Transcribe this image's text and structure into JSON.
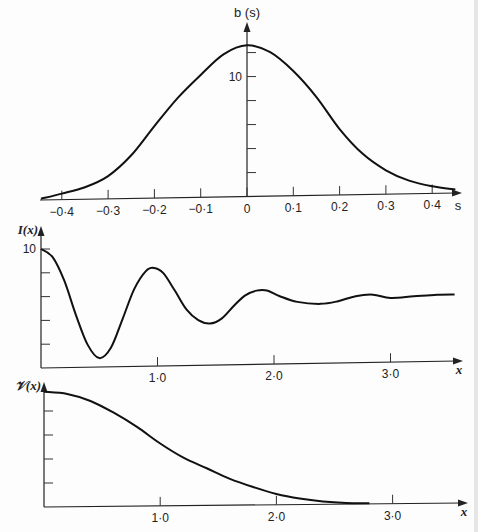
{
  "chart_data": [
    {
      "id": "top",
      "type": "line",
      "title": "",
      "ylabel": "b (s)",
      "xlabel": "s",
      "x_ticks": [
        -0.4,
        -0.3,
        -0.2,
        -0.1,
        0,
        0.1,
        0.2,
        0.3,
        0.4
      ],
      "x_tick_labels": [
        "−0·4",
        "−0·3",
        "−0·2",
        "−0·1",
        "0",
        "0·1",
        "0·2",
        "0·3",
        "0·4"
      ],
      "y_ticks": [
        2,
        4,
        6,
        8,
        10,
        12
      ],
      "y_tick_labels": {
        "10": "10"
      },
      "xlim": [
        -0.45,
        0.47
      ],
      "ylim": [
        0,
        14
      ],
      "grid": false,
      "legend": null,
      "series": [
        {
          "name": "b(s)",
          "x": [
            -0.445,
            -0.4,
            -0.35,
            -0.3,
            -0.25,
            -0.2,
            -0.15,
            -0.1,
            -0.05,
            0,
            0.05,
            0.1,
            0.15,
            0.2,
            0.25,
            0.3,
            0.35,
            0.4,
            0.45
          ],
          "y": [
            0.1,
            0.5,
            1.0,
            1.9,
            3.6,
            6.0,
            8.3,
            10.2,
            11.9,
            12.6,
            12.0,
            10.4,
            8.2,
            5.5,
            3.4,
            2.0,
            1.1,
            0.6,
            0.3
          ]
        }
      ]
    },
    {
      "id": "middle",
      "type": "line",
      "title": "",
      "ylabel": "I(x)",
      "xlabel": "x",
      "x_ticks": [
        1.0,
        2.0,
        3.0
      ],
      "x_tick_labels": [
        "1·0",
        "2·0",
        "3·0"
      ],
      "y_ticks": [
        2,
        4,
        6,
        8,
        10
      ],
      "y_tick_labels": {
        "10": "10"
      },
      "xlim": [
        0,
        3.6
      ],
      "ylim": [
        0,
        11.5
      ],
      "grid": false,
      "legend": null,
      "series": [
        {
          "name": "I(x)",
          "x": [
            0,
            0.1,
            0.2,
            0.3,
            0.4,
            0.5,
            0.6,
            0.7,
            0.8,
            0.9,
            0.97,
            1.05,
            1.15,
            1.25,
            1.35,
            1.45,
            1.55,
            1.65,
            1.75,
            1.85,
            1.94,
            2.05,
            2.2,
            2.4,
            2.55,
            2.7,
            2.85,
            3.0,
            3.2,
            3.4,
            3.55
          ],
          "y": [
            10.0,
            9.3,
            7.3,
            4.4,
            1.9,
            0.75,
            1.6,
            4.0,
            6.5,
            8.0,
            8.25,
            7.8,
            6.3,
            4.7,
            3.8,
            3.5,
            3.9,
            4.9,
            5.8,
            6.2,
            6.2,
            5.7,
            5.2,
            5.0,
            5.2,
            5.6,
            5.7,
            5.4,
            5.5,
            5.6,
            5.6
          ]
        }
      ]
    },
    {
      "id": "bottom",
      "type": "line",
      "title": "",
      "ylabel": "𝒱(x)",
      "xlabel": "x",
      "x_ticks": [
        1.0,
        2.0,
        3.0
      ],
      "x_tick_labels": [
        "1·0",
        "2·0",
        "3·0"
      ],
      "y_ticks": [
        1,
        2,
        3,
        4
      ],
      "y_tick_labels": {},
      "xlim": [
        0,
        3.6
      ],
      "ylim": [
        0,
        5.3
      ],
      "grid": false,
      "legend": null,
      "series": [
        {
          "name": "V(x)",
          "x": [
            0,
            0.2,
            0.4,
            0.6,
            0.8,
            1.0,
            1.2,
            1.4,
            1.6,
            1.8,
            2.0,
            2.2,
            2.4,
            2.6,
            2.8
          ],
          "y": [
            4.8,
            4.7,
            4.4,
            3.9,
            3.3,
            2.6,
            2.0,
            1.55,
            1.1,
            0.75,
            0.45,
            0.25,
            0.12,
            0.05,
            0.03
          ]
        }
      ]
    }
  ],
  "layout": {
    "panels": [
      {
        "x0": 247,
        "xscale": 463,
        "base_left": 200,
        "base_right": 193,
        "axis_left": 40,
        "axis_right": 462,
        "yaxis_x": 247,
        "yaxis_top": 22,
        "ypx_per_unit": 12
      },
      {
        "x0": 41,
        "xscale": 116.5,
        "base_left": 368,
        "base_right": 361,
        "axis_left": 41,
        "axis_right": 463,
        "yaxis_x": 41,
        "yaxis_top": 226,
        "ypx_per_unit": 11.9
      },
      {
        "x0": 44,
        "xscale": 116.2,
        "base_left": 507,
        "base_right": 503,
        "axis_left": 44,
        "axis_right": 468,
        "yaxis_x": 44,
        "yaxis_top": 382,
        "ypx_per_unit": 24
      }
    ]
  }
}
